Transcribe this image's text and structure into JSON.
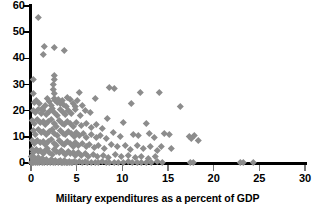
{
  "chart_data": {
    "type": "scatter",
    "title": "",
    "xlabel": "Military expenditures as a percent of GDP",
    "ylabel": "",
    "xlim": [
      0,
      30
    ],
    "ylim": [
      0,
      60
    ],
    "xticks": [
      0,
      5,
      10,
      15,
      20,
      25,
      30
    ],
    "yticks": [
      0,
      10,
      20,
      30,
      40,
      50,
      60
    ],
    "grid": false,
    "legend": null,
    "marker": "diamond",
    "marker_color": "#8c8c8c",
    "axis_color": "#000000",
    "background_color": "#ffffff",
    "points": [
      [
        0.85,
        55.5
      ],
      [
        1.5,
        44.5
      ],
      [
        1.4,
        41.6
      ],
      [
        2.6,
        44.2
      ],
      [
        3.6,
        43.0
      ],
      [
        0.3,
        32.0
      ],
      [
        2.5,
        33.5
      ],
      [
        2.5,
        31.8
      ],
      [
        2.4,
        30.2
      ],
      [
        2.4,
        28.0
      ],
      [
        2.5,
        26.6
      ],
      [
        0.2,
        26.8
      ],
      [
        5.3,
        27.0
      ],
      [
        8.6,
        28.8
      ],
      [
        9.1,
        28.4
      ],
      [
        12.0,
        26.9
      ],
      [
        14.0,
        26.9
      ],
      [
        16.3,
        21.8
      ],
      [
        2.6,
        24.6
      ],
      [
        2.7,
        23.8
      ],
      [
        2.9,
        23.2
      ],
      [
        3.0,
        24.2
      ],
      [
        3.2,
        23.0
      ],
      [
        3.4,
        24.0
      ],
      [
        3.5,
        22.5
      ],
      [
        2.2,
        22.0
      ],
      [
        2.0,
        23.4
      ],
      [
        1.8,
        24.8
      ],
      [
        1.6,
        22.2
      ],
      [
        1.2,
        21.0
      ],
      [
        0.9,
        22.8
      ],
      [
        0.6,
        24.0
      ],
      [
        0.35,
        23.2
      ],
      [
        4.0,
        25.2
      ],
      [
        4.3,
        24.4
      ],
      [
        4.6,
        23.0
      ],
      [
        5.1,
        23.8
      ],
      [
        7.0,
        24.6
      ],
      [
        11.0,
        23.0
      ],
      [
        0.2,
        20.0
      ],
      [
        0.5,
        19.5
      ],
      [
        0.8,
        20.6
      ],
      [
        1.1,
        19.0
      ],
      [
        1.4,
        20.2
      ],
      [
        1.7,
        18.6
      ],
      [
        2.0,
        19.8
      ],
      [
        2.3,
        20.8
      ],
      [
        2.6,
        19.2
      ],
      [
        2.9,
        18.2
      ],
      [
        3.2,
        20.4
      ],
      [
        3.5,
        19.4
      ],
      [
        3.8,
        18.8
      ],
      [
        4.1,
        20.0
      ],
      [
        4.4,
        19.0
      ],
      [
        4.9,
        20.6
      ],
      [
        5.4,
        18.4
      ],
      [
        5.9,
        20.2
      ],
      [
        6.5,
        19.2
      ],
      [
        3.9,
        21.6
      ],
      [
        4.8,
        21.8
      ],
      [
        5.6,
        22.1
      ],
      [
        8.4,
        17.0
      ],
      [
        10.1,
        15.6
      ],
      [
        12.6,
        15.2
      ],
      [
        0.15,
        16.2
      ],
      [
        0.4,
        15.0
      ],
      [
        0.7,
        16.8
      ],
      [
        1.0,
        15.4
      ],
      [
        1.3,
        16.0
      ],
      [
        1.6,
        14.6
      ],
      [
        1.9,
        15.8
      ],
      [
        2.2,
        16.6
      ],
      [
        2.5,
        15.0
      ],
      [
        2.8,
        14.2
      ],
      [
        3.1,
        16.2
      ],
      [
        3.4,
        15.2
      ],
      [
        3.7,
        14.8
      ],
      [
        4.0,
        16.0
      ],
      [
        4.3,
        15.0
      ],
      [
        4.6,
        14.0
      ],
      [
        5.0,
        15.6
      ],
      [
        5.5,
        14.4
      ],
      [
        6.0,
        15.0
      ],
      [
        6.6,
        13.8
      ],
      [
        7.2,
        14.6
      ],
      [
        7.8,
        13.2
      ],
      [
        0.2,
        12.4
      ],
      [
        0.5,
        11.0
      ],
      [
        0.8,
        12.8
      ],
      [
        1.1,
        11.6
      ],
      [
        1.4,
        12.2
      ],
      [
        1.7,
        10.8
      ],
      [
        2.0,
        12.0
      ],
      [
        2.3,
        12.8
      ],
      [
        2.6,
        11.2
      ],
      [
        2.9,
        10.4
      ],
      [
        3.2,
        12.4
      ],
      [
        3.5,
        11.4
      ],
      [
        3.8,
        11.0
      ],
      [
        4.1,
        12.2
      ],
      [
        4.4,
        11.2
      ],
      [
        4.7,
        10.2
      ],
      [
        5.0,
        11.8
      ],
      [
        5.3,
        10.6
      ],
      [
        5.7,
        11.2
      ],
      [
        6.1,
        10.0
      ],
      [
        6.6,
        11.0
      ],
      [
        7.1,
        9.8
      ],
      [
        7.6,
        10.6
      ],
      [
        8.2,
        9.4
      ],
      [
        9.0,
        11.6
      ],
      [
        9.8,
        10.2
      ],
      [
        11.2,
        11.0
      ],
      [
        11.8,
        10.4
      ],
      [
        12.9,
        11.2
      ],
      [
        13.5,
        10.0
      ],
      [
        14.6,
        11.4
      ],
      [
        15.1,
        10.8
      ],
      [
        17.3,
        10.2
      ],
      [
        17.6,
        9.4
      ],
      [
        17.9,
        10.6
      ],
      [
        18.3,
        8.6
      ],
      [
        0.1,
        8.6
      ],
      [
        0.4,
        7.4
      ],
      [
        0.7,
        8.8
      ],
      [
        1.0,
        7.8
      ],
      [
        1.3,
        8.4
      ],
      [
        1.6,
        7.0
      ],
      [
        1.9,
        8.2
      ],
      [
        2.2,
        9.0
      ],
      [
        2.5,
        7.4
      ],
      [
        2.8,
        6.6
      ],
      [
        3.1,
        8.6
      ],
      [
        3.4,
        7.6
      ],
      [
        3.7,
        7.2
      ],
      [
        4.0,
        8.4
      ],
      [
        4.3,
        7.4
      ],
      [
        4.6,
        6.4
      ],
      [
        4.9,
        8.0
      ],
      [
        5.2,
        6.8
      ],
      [
        5.6,
        7.4
      ],
      [
        6.0,
        6.2
      ],
      [
        6.4,
        7.2
      ],
      [
        6.9,
        6.0
      ],
      [
        7.4,
        6.8
      ],
      [
        8.0,
        5.6
      ],
      [
        8.8,
        7.0
      ],
      [
        9.4,
        6.2
      ],
      [
        10.3,
        6.8
      ],
      [
        10.9,
        5.4
      ],
      [
        11.6,
        6.6
      ],
      [
        12.3,
        5.8
      ],
      [
        13.1,
        6.4
      ],
      [
        13.8,
        5.0
      ],
      [
        14.3,
        6.2
      ],
      [
        15.4,
        5.6
      ],
      [
        0.1,
        5.2
      ],
      [
        0.3,
        4.2
      ],
      [
        0.55,
        5.4
      ],
      [
        0.8,
        4.6
      ],
      [
        1.05,
        5.0
      ],
      [
        1.3,
        3.8
      ],
      [
        1.55,
        4.8
      ],
      [
        1.8,
        5.6
      ],
      [
        2.05,
        4.2
      ],
      [
        2.3,
        3.4
      ],
      [
        2.55,
        5.2
      ],
      [
        2.8,
        4.4
      ],
      [
        3.05,
        4.0
      ],
      [
        3.3,
        5.0
      ],
      [
        3.55,
        4.2
      ],
      [
        3.8,
        3.2
      ],
      [
        4.05,
        4.6
      ],
      [
        4.3,
        3.6
      ],
      [
        4.6,
        4.2
      ],
      [
        4.9,
        3.0
      ],
      [
        5.2,
        4.0
      ],
      [
        5.5,
        2.8
      ],
      [
        5.9,
        3.6
      ],
      [
        6.3,
        2.6
      ],
      [
        6.8,
        3.4
      ],
      [
        7.3,
        2.4
      ],
      [
        7.9,
        3.0
      ],
      [
        8.5,
        2.2
      ],
      [
        9.2,
        3.2
      ],
      [
        9.9,
        2.4
      ],
      [
        10.6,
        2.8
      ],
      [
        11.4,
        2.0
      ],
      [
        12.1,
        2.6
      ],
      [
        12.8,
        1.8
      ],
      [
        13.6,
        2.4
      ],
      [
        0.05,
        2.4
      ],
      [
        0.2,
        1.6
      ],
      [
        0.4,
        2.2
      ],
      [
        0.6,
        1.2
      ],
      [
        0.8,
        2.0
      ],
      [
        1.0,
        1.0
      ],
      [
        1.2,
        1.8
      ],
      [
        1.45,
        0.9
      ],
      [
        1.7,
        1.6
      ],
      [
        1.95,
        0.7
      ],
      [
        2.2,
        1.4
      ],
      [
        2.45,
        0.6
      ],
      [
        2.7,
        1.2
      ],
      [
        2.95,
        0.5
      ],
      [
        3.2,
        1.0
      ],
      [
        3.45,
        0.4
      ],
      [
        3.7,
        0.9
      ],
      [
        3.95,
        0.35
      ],
      [
        4.2,
        0.8
      ],
      [
        4.45,
        0.3
      ],
      [
        4.7,
        0.7
      ],
      [
        5.0,
        0.25
      ],
      [
        5.3,
        0.6
      ],
      [
        5.6,
        0.2
      ],
      [
        5.9,
        0.5
      ],
      [
        6.2,
        0.4
      ],
      [
        6.6,
        0.3
      ],
      [
        7.0,
        0.45
      ],
      [
        7.4,
        0.25
      ],
      [
        7.8,
        0.5
      ],
      [
        8.2,
        0.3
      ],
      [
        8.6,
        0.4
      ],
      [
        9.1,
        0.2
      ],
      [
        9.6,
        0.45
      ],
      [
        10.1,
        0.3
      ],
      [
        10.6,
        0.5
      ],
      [
        11.1,
        0.25
      ],
      [
        11.6,
        0.4
      ],
      [
        12.1,
        0.2
      ],
      [
        12.6,
        0.45
      ],
      [
        13.2,
        0.3
      ],
      [
        13.8,
        0.5
      ],
      [
        14.4,
        0.25
      ],
      [
        17.4,
        0.3
      ],
      [
        17.8,
        0.35
      ],
      [
        22.9,
        0.3
      ],
      [
        23.2,
        0.25
      ],
      [
        24.3,
        0.3
      ],
      [
        0.05,
        0.15
      ],
      [
        0.15,
        0.1
      ],
      [
        0.3,
        0.2
      ],
      [
        0.5,
        0.1
      ],
      [
        0.7,
        0.15
      ],
      [
        0.95,
        0.1
      ],
      [
        1.2,
        0.2
      ],
      [
        1.5,
        0.1
      ],
      [
        1.8,
        0.15
      ],
      [
        2.1,
        0.1
      ],
      [
        2.4,
        0.2
      ],
      [
        2.7,
        0.1
      ],
      [
        3.0,
        0.15
      ],
      [
        3.3,
        0.1
      ],
      [
        3.6,
        0.2
      ],
      [
        3.9,
        0.1
      ],
      [
        4.2,
        0.15
      ],
      [
        4.5,
        0.1
      ]
    ]
  }
}
